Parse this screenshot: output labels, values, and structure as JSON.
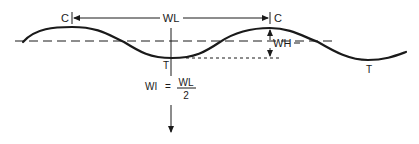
{
  "diagram": {
    "labels": {
      "crest_left": "C",
      "crest_right": "C",
      "wavelength": "WL",
      "wave_height": "WH",
      "trough_left": "T",
      "trough_right": "T"
    },
    "formula": {
      "lhs": "WI",
      "equals": "=",
      "numerator": "WL",
      "denominator": "2"
    },
    "colors": {
      "stroke": "#1a1a1a",
      "background": "#ffffff"
    }
  }
}
